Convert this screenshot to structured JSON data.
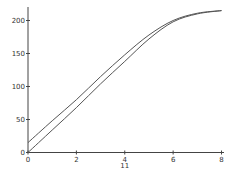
{
  "chart_data": {
    "type": "line",
    "title": "",
    "xlabel": "",
    "ylabel": "",
    "xlim": [
      0,
      8
    ],
    "ylim": [
      0,
      220
    ],
    "grid": false,
    "legend": null,
    "x_ticks": [
      "0",
      "2",
      "4",
      "6",
      "8"
    ],
    "x_tick_values": [
      0,
      2,
      4,
      6,
      8
    ],
    "y_ticks": [
      "0",
      "50",
      "100",
      "150",
      "200"
    ],
    "y_tick_values": [
      0,
      50,
      100,
      150,
      200
    ],
    "annotations": [
      {
        "text": "11",
        "x": 4,
        "position": "below x-tick 4"
      }
    ],
    "x": [
      0,
      1,
      2,
      3,
      4,
      5,
      6,
      7,
      8
    ],
    "series": [
      {
        "name": "upper",
        "color": "#555555",
        "values": [
          15,
          48,
          80,
          115,
          148,
          178,
          200,
          211,
          215
        ]
      },
      {
        "name": "lower",
        "color": "#555555",
        "values": [
          0,
          34,
          68,
          104,
          138,
          172,
          198,
          210,
          215
        ]
      }
    ]
  }
}
